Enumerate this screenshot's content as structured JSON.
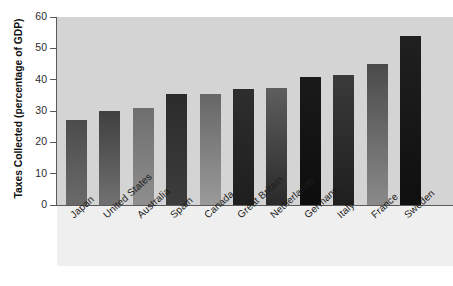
{
  "chart_data": {
    "type": "bar",
    "title": "",
    "xlabel": "",
    "ylabel": "Taxes Collected (percentage of GDP)",
    "ylim": [
      0,
      60
    ],
    "yticks": [
      0,
      10,
      20,
      30,
      40,
      50,
      60
    ],
    "grid": false,
    "legend": "none",
    "categories": [
      "Japan",
      "United States",
      "Australia",
      "Spain",
      "Canada",
      "Great Britain",
      "Netherlands",
      "Germany",
      "Italy",
      "France",
      "Sweden"
    ],
    "values": [
      27,
      30,
      31,
      35.5,
      35.5,
      37,
      37.5,
      41,
      41.5,
      45,
      54
    ],
    "bar_colors_top": [
      "#4c4c4c",
      "#3f3f3f",
      "#6e6e6e",
      "#2b2b2b",
      "#666666",
      "#2e2e2e",
      "#5e5e5e",
      "#1a1a1a",
      "#3a3a3a",
      "#4a4a4a",
      "#202020"
    ],
    "bar_colors_bottom": [
      "#6a6a6a",
      "#717171",
      "#8e8e8e",
      "#3d3d3d",
      "#9a9a9a",
      "#1e1e1e",
      "#2a2a2a",
      "#0d0d0d",
      "#1f1f1f",
      "#8a8a8a",
      "#0f0f0f"
    ]
  },
  "colors": {
    "panel_background": "#d4d4d4",
    "label_background": "#efefef",
    "axis": "#5a5a5a",
    "page_background": "#ffffff",
    "text": "#1c1c1c"
  }
}
